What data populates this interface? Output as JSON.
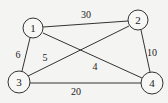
{
  "graph": {
    "type": "undirected-weighted",
    "nodes": [
      {
        "id": "1",
        "label": "1",
        "x": 33,
        "y": 28,
        "r": 10
      },
      {
        "id": "2",
        "label": "2",
        "x": 138,
        "y": 20,
        "r": 10
      },
      {
        "id": "3",
        "label": "3",
        "x": 19,
        "y": 82,
        "r": 11
      },
      {
        "id": "4",
        "label": "4",
        "x": 152,
        "y": 83,
        "r": 11
      }
    ],
    "edges": [
      {
        "from": "1",
        "to": "2",
        "weight": "30",
        "label_x": 86,
        "label_y": 14
      },
      {
        "from": "1",
        "to": "3",
        "weight": "6",
        "label_x": 18,
        "label_y": 54
      },
      {
        "from": "3",
        "to": "2",
        "weight": "5",
        "label_x": 45,
        "label_y": 57
      },
      {
        "from": "1",
        "to": "4",
        "weight": "4",
        "label_x": 95,
        "label_y": 66
      },
      {
        "from": "2",
        "to": "4",
        "weight": "10",
        "label_x": 152,
        "label_y": 52
      },
      {
        "from": "3",
        "to": "4",
        "weight": "20",
        "label_x": 76,
        "label_y": 91
      }
    ]
  }
}
